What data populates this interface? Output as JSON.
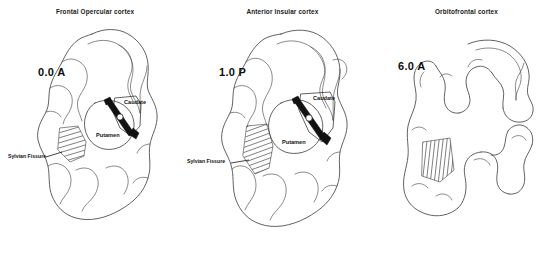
{
  "figure": {
    "caption_type": "coronal-brain-sections",
    "panel_count": 3
  },
  "panels": [
    {
      "title": "Frontal Opercular cortex",
      "ap_coordinate": "0.0 A",
      "structures": [
        {
          "name": "Caudate",
          "label": "Caudate"
        },
        {
          "name": "Putamen",
          "label": "Putamen"
        }
      ],
      "fissure_label": "Sylvian Fissure",
      "has_electrode_track": true,
      "has_hatched_fissure": true
    },
    {
      "title": "Anterior Insular cortex",
      "ap_coordinate": "1.0 P",
      "structures": [
        {
          "name": "Caudate",
          "label": "Caudate"
        },
        {
          "name": "Putamen",
          "label": "Putamen"
        }
      ],
      "fissure_label": "Sylvian Fissure",
      "has_electrode_track": true,
      "has_hatched_fissure": true
    },
    {
      "title": "Orbitofrontal cortex",
      "ap_coordinate": "6.0 A",
      "structures": [],
      "fissure_label": "",
      "has_electrode_track": false,
      "has_hatched_fissure": true
    }
  ],
  "colors": {
    "background": "#ffffff",
    "outline": "#3a3a3a",
    "text": "#111111",
    "electrode": "#111111"
  }
}
